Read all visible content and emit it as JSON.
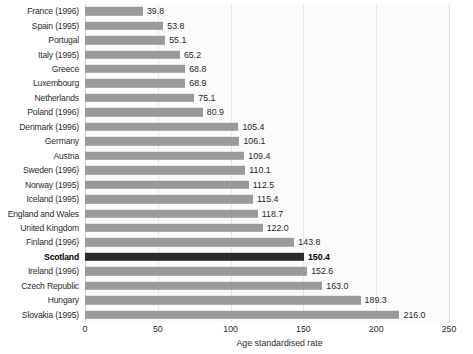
{
  "chart_data": {
    "type": "bar",
    "orientation": "horizontal",
    "title": "",
    "subtitle": "",
    "xlabel": "Age standardised rate",
    "ylabel": "",
    "xlim": [
      0,
      250
    ],
    "xticks": [
      0,
      50,
      100,
      150,
      200,
      250
    ],
    "xtick_labels": [
      "0",
      "50",
      "100",
      "150",
      "200",
      "250"
    ],
    "grid": "vertical",
    "legend": "none",
    "highlight_category": "Scotland",
    "categories": [
      "France (1996)",
      "Spain (1995)",
      "Portugal",
      "Italy (1995)",
      "Greece",
      "Luxembourg",
      "Netherlands",
      "Poland (1996)",
      "Denmark (1996)",
      "Germany",
      "Austria",
      "Sweden (1996)",
      "Norway (1995)",
      "Iceland (1995)",
      "England and Wales",
      "United Kingdom",
      "Finland (1996)",
      "Scotland",
      "Ireland (1996)",
      "Czech Republic",
      "Hungary",
      "Slovakia (1995)"
    ],
    "values": [
      39.8,
      53.8,
      55.1,
      65.2,
      68.8,
      68.9,
      75.1,
      80.9,
      105.4,
      106.1,
      109.4,
      110.1,
      112.5,
      115.4,
      118.7,
      122.0,
      143.8,
      150.4,
      152.6,
      163.0,
      189.3,
      216.0
    ],
    "value_labels": [
      "39.8",
      "53.8",
      "55.1",
      "65.2",
      "68.8",
      "68.9",
      "75.1",
      "80.9",
      "105.4",
      "106.1",
      "109.4",
      "110.1",
      "112.5",
      "115.4",
      "118.7",
      "122.0",
      "143.8",
      "150.4",
      "152.6",
      "163.0",
      "189.3",
      "216.0"
    ],
    "colors": {
      "bar": "#9a9a9a",
      "bar_highlight": "#2b2b2b",
      "plot_background": "#fbfbfb",
      "gridline": "#e6e6e6",
      "text": "#2b2b2b"
    }
  }
}
